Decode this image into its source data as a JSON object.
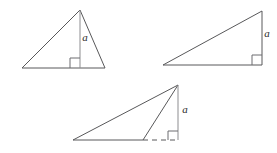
{
  "figure": {
    "background_color": "#ffffff",
    "edge_color": "#58585a",
    "altitude_color": "#8d8d90",
    "label_color": "#2b2b2d",
    "label_text": "a",
    "panels": [
      {
        "id": "acute-triangle",
        "name": "acute-triangle-with-interior-altitude",
        "label": "a",
        "label_x": 85,
        "label_y": 41,
        "vertices": "22,68 80,10 105,68",
        "altitude": "80,10 80,68",
        "right_angle": "70,68 70,58 80,58",
        "has_extension": false
      },
      {
        "id": "right-triangle",
        "name": "right-triangle-with-leg-altitude",
        "label": "a",
        "label_x": 267,
        "label_y": 37,
        "vertices": "163,65 262,11 262,65",
        "altitude": "262,11 262,65",
        "right_angle": "252,65 252,55 262,55",
        "has_extension": false
      },
      {
        "id": "obtuse-triangle",
        "name": "obtuse-triangle-with-exterior-altitude",
        "label": "a",
        "label_x": 185,
        "label_y": 113,
        "vertices": "73,140 178,85 143,140",
        "altitude": "178,85 178,140",
        "right_angle": "168,140 168,131 178,131",
        "has_extension": true,
        "extension": "143,140 178,140"
      }
    ]
  }
}
